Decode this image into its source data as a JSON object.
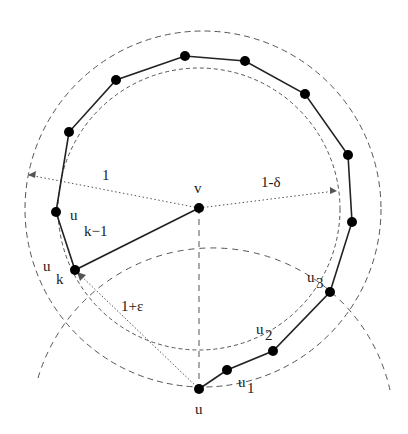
{
  "figure": {
    "labels": {
      "v": "v",
      "u": "u",
      "u1_base": "u",
      "u1_sub": "1",
      "u2_base": "u",
      "u2_sub": "2",
      "u3_base": "u",
      "u3_sub": "3",
      "uk_base": "u",
      "uk_sub": "k",
      "ukm1_base": "u",
      "ukm1_sub": "k−1",
      "radius_outer": "1",
      "radius_inner": "1-δ",
      "radius_u": "1+ε"
    },
    "colors": {
      "node": "#000000",
      "edge": "#222222",
      "dashed": "#555555",
      "dotted": "#555555"
    },
    "nodes": [
      {
        "id": "v",
        "x": 199,
        "y": 208
      },
      {
        "id": "u",
        "x": 199,
        "y": 389
      },
      {
        "id": "u1",
        "x": 227,
        "y": 370
      },
      {
        "id": "u2",
        "x": 273,
        "y": 351
      },
      {
        "id": "u3",
        "x": 330,
        "y": 292
      },
      {
        "id": "p5",
        "x": 352,
        "y": 222
      },
      {
        "id": "p6",
        "x": 348,
        "y": 155
      },
      {
        "id": "p7",
        "x": 305,
        "y": 94
      },
      {
        "id": "p8",
        "x": 245,
        "y": 61
      },
      {
        "id": "p9",
        "x": 185,
        "y": 56
      },
      {
        "id": "p10",
        "x": 116,
        "y": 80
      },
      {
        "id": "p11",
        "x": 69,
        "y": 132
      },
      {
        "id": "uk-1",
        "x": 56,
        "y": 212
      },
      {
        "id": "uk",
        "x": 75,
        "y": 270
      }
    ]
  }
}
